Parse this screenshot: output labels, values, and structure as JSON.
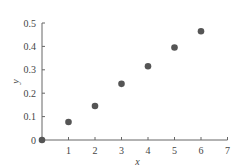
{
  "chart_data": {
    "type": "scatter",
    "title": "",
    "xlabel": "x",
    "ylabel": "y",
    "x": [
      0,
      1,
      2,
      3,
      4,
      5,
      6
    ],
    "y": [
      0,
      0.077,
      0.145,
      0.24,
      0.315,
      0.395,
      0.465
    ],
    "xlim": [
      0,
      7
    ],
    "ylim": [
      0,
      0.5
    ],
    "xticks": [
      "1",
      "2",
      "3",
      "4",
      "5",
      "6",
      "7"
    ],
    "yticks": [
      "0",
      "0.1",
      "0.2",
      "0.3",
      "0.4",
      "0.5"
    ],
    "grid": false,
    "legend": null,
    "marker_color": "#555555",
    "axis_color": "#666666"
  }
}
